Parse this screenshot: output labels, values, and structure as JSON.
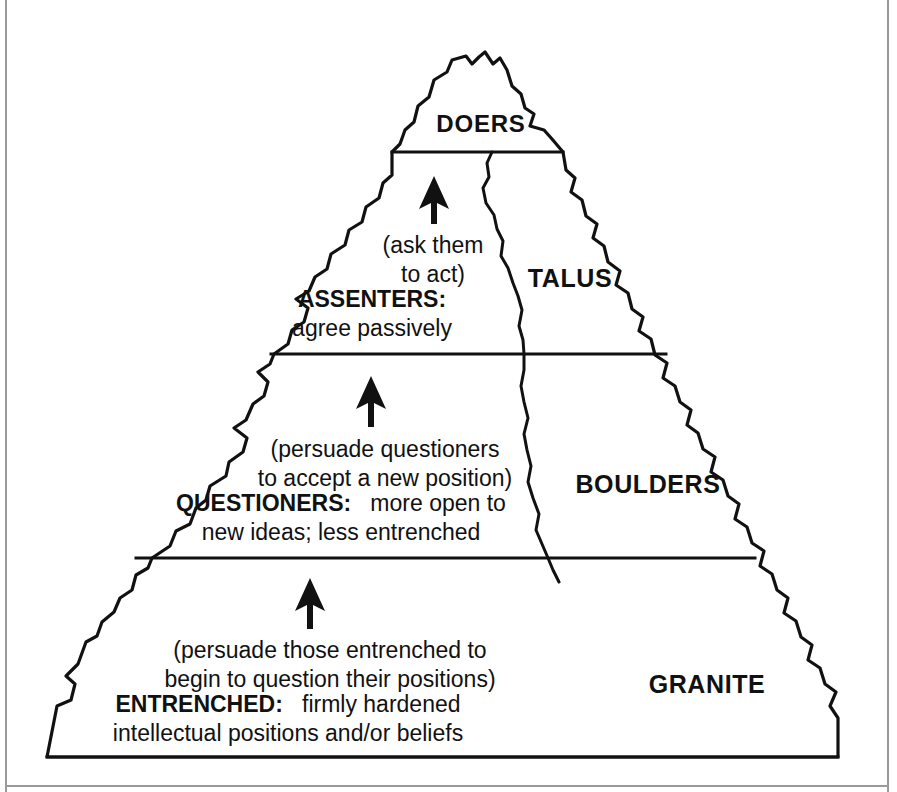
{
  "diagram": {
    "summit_label": "DOERS",
    "rock_layers": [
      {
        "name": "talus-label",
        "text": "TALUS"
      },
      {
        "name": "boulders-label",
        "text": "BOULDERS"
      },
      {
        "name": "granite-label",
        "text": "GRANITE"
      }
    ],
    "bands": [
      {
        "id": "doers",
        "heading": "DOERS",
        "action_lines": [],
        "description_lines": []
      },
      {
        "id": "assenters",
        "action_lines": [
          "(ask them",
          "to act)"
        ],
        "heading": "ASSENTERS:",
        "description_lines": [
          "agree passively"
        ]
      },
      {
        "id": "questioners",
        "action_lines": [
          "(persuade questioners",
          "to accept a new position)"
        ],
        "heading": "QUESTIONERS:",
        "description_inline": "more open to",
        "description_lines": [
          "new ideas; less entrenched"
        ]
      },
      {
        "id": "entrenched",
        "action_lines": [
          "(persuade those entrenched to",
          "begin to question their positions)"
        ],
        "heading": "ENTRENCHED:",
        "description_inline": "firmly hardened",
        "description_lines": [
          "intellectual positions and/or beliefs"
        ]
      }
    ],
    "arrows": [
      {
        "name": "arrow-to-doers"
      },
      {
        "name": "arrow-to-assenters"
      },
      {
        "name": "arrow-to-questioners"
      }
    ],
    "colors": {
      "ink": "#111111",
      "paper": "#ffffff",
      "frame": "#9a9a9a"
    }
  }
}
